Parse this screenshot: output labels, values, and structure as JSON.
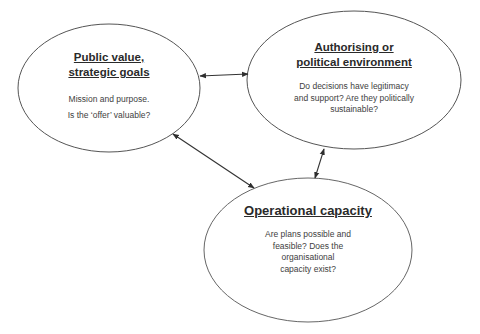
{
  "diagram": {
    "type": "triangle-of-relationships",
    "nodes": [
      {
        "id": "public-value",
        "title": "Public value, strategic goals",
        "title_lines": [
          "Public value,",
          "strategic goals"
        ],
        "description_lines": [
          "Mission and purpose.",
          "Is the ‘offer’ valuable?"
        ]
      },
      {
        "id": "authorising-environment",
        "title": "Authorising or political environment",
        "title_lines": [
          "Authorising or",
          "political environment"
        ],
        "description_lines": [
          "Do decisions have legitimacy",
          "and support? Are they politically",
          "sustainable?"
        ]
      },
      {
        "id": "operational-capacity",
        "title": "Operational capacity",
        "title_lines": [
          "Operational capacity"
        ],
        "description_lines": [
          "Are plans possible and",
          "feasible? Does the",
          "organisational",
          "capacity exist?"
        ]
      }
    ],
    "edges": [
      {
        "from": "public-value",
        "to": "authorising-environment",
        "direction": "bidirectional"
      },
      {
        "from": "public-value",
        "to": "operational-capacity",
        "direction": "bidirectional"
      },
      {
        "from": "authorising-environment",
        "to": "operational-capacity",
        "direction": "bidirectional"
      }
    ],
    "colors": {
      "outline": "#555555",
      "arrow": "#333333",
      "text": "#3a3a3a",
      "background": "#ffffff"
    }
  }
}
